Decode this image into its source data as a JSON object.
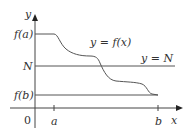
{
  "diagram": {
    "axes": {
      "x_label": "x",
      "y_label": "y",
      "origin_label": "0"
    },
    "y_ticks": [
      {
        "label": "f(a)"
      },
      {
        "label": "N"
      },
      {
        "label": "f(b)"
      }
    ],
    "x_ticks": [
      {
        "label": "a"
      },
      {
        "label": "b"
      }
    ],
    "curve_label": "y = f(x)",
    "line_label": "y = N",
    "colors": {
      "axes": "#444444",
      "curve": "#555555",
      "text": "#333333"
    }
  }
}
